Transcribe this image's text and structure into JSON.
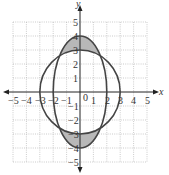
{
  "diagram": {
    "type": "coordinate-plane-graph",
    "axes": {
      "x_label": "x",
      "y_label": "y",
      "x_range": [
        -5,
        5
      ],
      "y_range": [
        -5,
        5
      ],
      "x_ticks": [
        "−5",
        "−4",
        "−3",
        "−2",
        "−1",
        "0",
        "1",
        "2",
        "3",
        "4",
        "5"
      ],
      "y_ticks": [
        "5",
        "4",
        "3",
        "2",
        "1",
        "−1",
        "−2",
        "−3",
        "−4",
        "−5"
      ],
      "origin_label": "0"
    },
    "grid": true,
    "curves": [
      {
        "name": "circle",
        "equation": "x^2 + y^2 = 9",
        "radius": 3
      },
      {
        "name": "ellipse",
        "equation": "x^2/4 + y^2/16 = 1",
        "semi_x": 2,
        "semi_y": 4
      }
    ],
    "shaded_regions": "inside ellipse, outside circle (top and bottom lenses)",
    "colors": {
      "shade": "#b8b8b8",
      "curve": "#444444",
      "grid": "#aaaaaa",
      "axis": "#222222"
    }
  }
}
